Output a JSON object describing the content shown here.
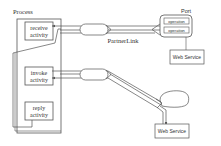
{
  "process": {
    "title": "Process",
    "activities": [
      {
        "line1": "receive",
        "line2": "activity"
      },
      {
        "line1": "invoke",
        "line2": "activity"
      },
      {
        "line1": "reply",
        "line2": "activity"
      }
    ]
  },
  "partner_link": {
    "label": "PartnerLink"
  },
  "port": {
    "title": "Port",
    "operations": [
      "operation",
      "operation"
    ]
  },
  "web_services": [
    {
      "label": "Web Service"
    },
    {
      "label": "Web Service"
    }
  ],
  "colors": {
    "stroke": "#555555",
    "text": "#333333",
    "background": "#ffffff"
  }
}
